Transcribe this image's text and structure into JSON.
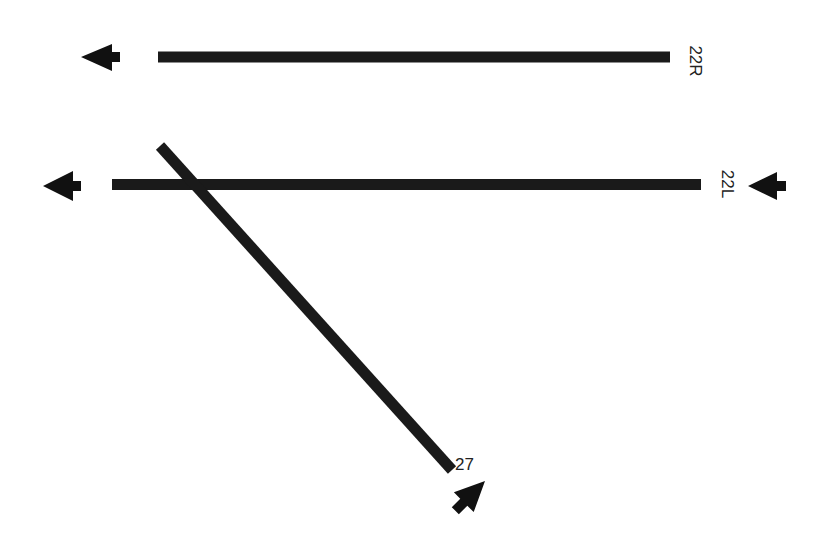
{
  "diagram": {
    "title": "",
    "background": "#ffffff",
    "ink_color": "#1a1a1a",
    "runways": [
      {
        "id": "22R",
        "label": "22R",
        "x1": 158,
        "y1": 57,
        "x2": 670,
        "y2": 57,
        "label_x": 694,
        "label_y": 61,
        "label_rotation": 90
      },
      {
        "id": "22L",
        "label": "22L",
        "x1": 112,
        "y1": 184.5,
        "x2": 701,
        "y2": 184.5,
        "label_x": 726,
        "label_y": 184,
        "label_rotation": 90
      },
      {
        "id": "27",
        "label": "27",
        "x1": 160,
        "y1": 146,
        "x2": 452,
        "y2": 470,
        "label_x": 466,
        "label_y": 466,
        "label_rotation": 0
      }
    ],
    "arrows": [
      {
        "id": "arrow-22r-departure",
        "direction": "left",
        "tip_x": 81,
        "tip_y": 57
      },
      {
        "id": "arrow-22l-departure",
        "direction": "left",
        "tip_x": 43,
        "tip_y": 186
      },
      {
        "id": "arrow-22l-approach",
        "direction": "left",
        "tip_x": 748,
        "tip_y": 186
      },
      {
        "id": "arrow-27-approach",
        "direction": "up-left",
        "tip_x": 485,
        "tip_y": 481
      }
    ]
  }
}
